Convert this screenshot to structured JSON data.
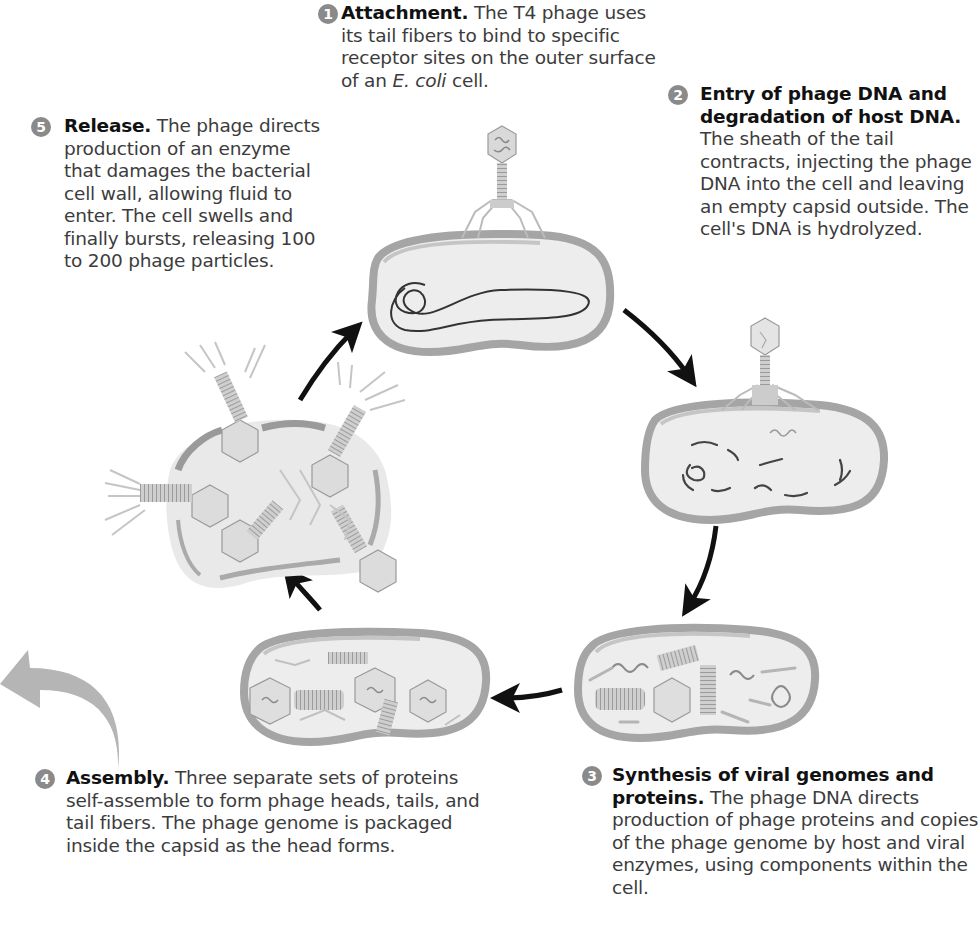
{
  "diagram": {
    "steps": [
      {
        "number": "1",
        "title": "Attachment.",
        "text_before_italic": " The T4 phage uses its tail fibers to bind to specific receptor sites on the outer surface of an ",
        "italic": "E. coli",
        "text_after_italic": " cell.",
        "illustration": "phage-attached-to-cell"
      },
      {
        "number": "2",
        "title": "Entry of phage DNA and degradation of host DNA.",
        "text": " The sheath of the tail contracts, injecting the phage DNA into the cell and leaving an empty capsid outside. The cell's DNA is hydrolyzed.",
        "illustration": "phage-injecting-dna"
      },
      {
        "number": "3",
        "title": "Synthesis of viral genomes and proteins.",
        "text": " The phage DNA directs production of phage proteins and copies of the phage genome by host and viral enzymes, using components within the cell.",
        "illustration": "cell-with-phage-components"
      },
      {
        "number": "4",
        "title": "Assembly.",
        "text": " Three separate sets of proteins self-assemble to form phage heads, tails, and tail fibers. The phage genome is packaged inside the capsid as the head forms.",
        "illustration": "cell-with-assembled-phages"
      },
      {
        "number": "5",
        "title": "Release.",
        "text": " The phage directs production of an enzyme that damages the bacterial cell wall, allowing fluid to enter. The cell swells and finally bursts, releasing 100 to 200 phage particles.",
        "illustration": "burst-cell-releasing-phages"
      }
    ],
    "arrows": [
      "step1-to-step2",
      "step2-to-step3",
      "step3-to-step4",
      "step4-to-step5",
      "step5-to-step1"
    ],
    "colors": {
      "badge": "#8a8a8a",
      "cell_wall": "#a9a9a9",
      "cell_fill": "#e6e6e6",
      "dna": "#333333",
      "arrow": "#111111",
      "big_arrow": "#b5b5b5"
    }
  }
}
